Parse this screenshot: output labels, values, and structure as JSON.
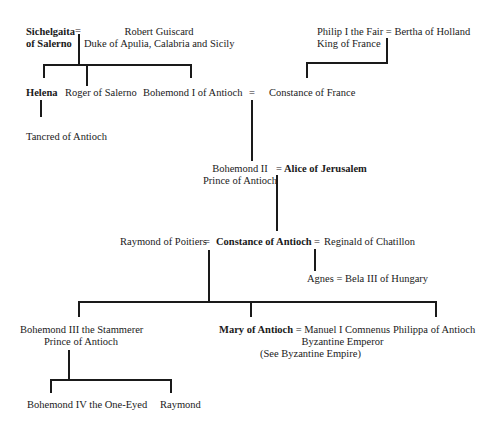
{
  "people": {
    "sichelgaita": {
      "line1": "Sichelgaita",
      "line2": "of Salerno"
    },
    "robert": {
      "line1": "Robert Guiscard",
      "line2": "Duke of Apulia, Calabria and Sicily"
    },
    "philip": {
      "line1": "Philip I the Fair",
      "line2": "King of France"
    },
    "bertha": "Bertha of Holland",
    "helena": "Helena",
    "roger": "Roger of Salerno",
    "bohemond1": "Bohemond I of Antioch",
    "constance_france": "Constance of France",
    "tancred": "Tancred of Antioch",
    "bohemond2": {
      "line1": "Bohemond II",
      "line2": "Prince of Antioch"
    },
    "alice": "Alice of Jerusalem",
    "raymond_poitiers": "Raymond of Poitiers",
    "constance_antioch": "Constance of Antioch",
    "reginald": "Reginald of Chatillon",
    "agnes": "Agnes",
    "bela": "Bela III of Hungary",
    "bohemond3": {
      "line1": "Bohemond III the Stammerer",
      "line2": "Prince of Antioch"
    },
    "mary": "Mary of Antioch",
    "manuel": {
      "line1": "Manuel I Comnenus",
      "line2": "Byzantine Emperor",
      "line3": "(See Byzantine Empire)"
    },
    "philippa": "Philippa of Antioch",
    "bohemond4": "Bohemond IV the One-Eyed",
    "raymond": "Raymond"
  },
  "marriage_symbol": "="
}
